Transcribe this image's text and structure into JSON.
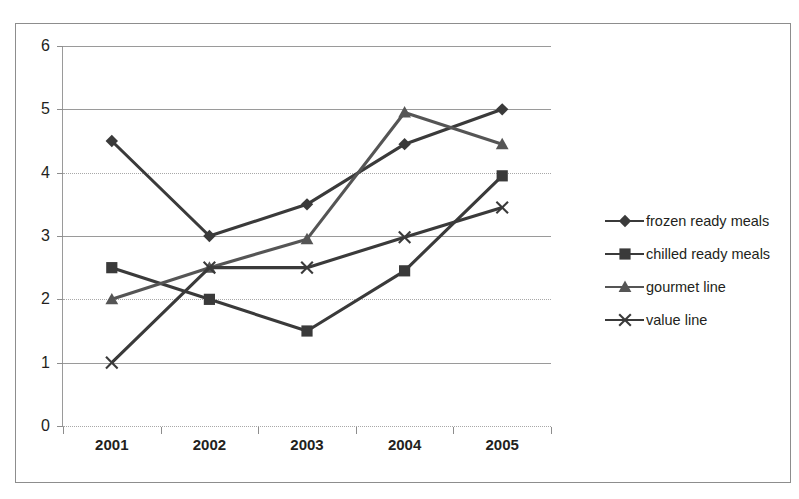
{
  "chart_data": {
    "type": "line",
    "title": "",
    "xlabel": "",
    "ylabel": "",
    "categories": [
      "2001",
      "2002",
      "2003",
      "2004",
      "2005"
    ],
    "ylim": [
      0,
      6
    ],
    "yticks": [
      "0",
      "1",
      "2",
      "3",
      "4",
      "5",
      "6"
    ],
    "grid": true,
    "legend_position": "right",
    "series": [
      {
        "name": "frozen ready meals",
        "marker": "diamond",
        "color": "#3a3a3a",
        "values": [
          4.5,
          3.0,
          3.5,
          4.45,
          5.0
        ]
      },
      {
        "name": "chilled ready meals",
        "marker": "square",
        "color": "#3a3a3a",
        "values": [
          2.5,
          2.0,
          1.5,
          2.45,
          3.95
        ]
      },
      {
        "name": "gourmet line",
        "marker": "triangle",
        "color": "#555555",
        "values": [
          2.0,
          2.5,
          2.95,
          4.95,
          4.45
        ]
      },
      {
        "name": "value line",
        "marker": "cross",
        "color": "#3a3a3a",
        "values": [
          1.0,
          2.5,
          2.5,
          2.98,
          3.45
        ]
      }
    ]
  },
  "axes": {
    "y_tick_labels": [
      "6",
      "5",
      "4",
      "3",
      "2",
      "1",
      "0"
    ],
    "x_tick_labels": [
      "2001",
      "2002",
      "2003",
      "2004",
      "2005"
    ]
  },
  "legend": {
    "items": [
      {
        "label": "frozen ready meals",
        "marker": "diamond-marker-icon"
      },
      {
        "label": "chilled ready meals",
        "marker": "square-marker-icon"
      },
      {
        "label": "gourmet line",
        "marker": "triangle-marker-icon"
      },
      {
        "label": "value line",
        "marker": "cross-marker-icon"
      }
    ]
  }
}
